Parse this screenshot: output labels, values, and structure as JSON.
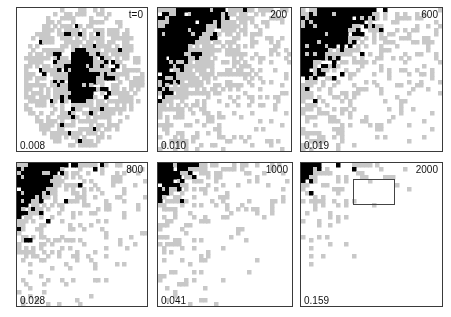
{
  "figure": {
    "width": 451,
    "height": 317,
    "background": "#ffffff",
    "colors": {
      "occupied": "#000000",
      "halo": "#c8c8c8",
      "empty": "#ffffff",
      "frame": "#3a3a3a",
      "text": "#111111",
      "roi": "#444444"
    },
    "grid": {
      "rows": 2,
      "cols": 3
    }
  },
  "panels": [
    {
      "id": "panel-t0",
      "time_label": "t=0",
      "value_side": "0.003",
      "value_bottom": "0.008",
      "rect": {
        "x": 16,
        "y": 7,
        "w": 132,
        "h": 145
      },
      "roi": null,
      "pattern": {
        "type": "blob",
        "cells": 36,
        "cx": 0.49,
        "cy": 0.48,
        "rx": 0.44,
        "ry": 0.46,
        "core_rx": 0.1,
        "core_ry": 0.2,
        "black_scatter_rx": 0.3,
        "black_scatter_ry": 0.34,
        "black_density": 0.3,
        "gray_density": 0.8,
        "elongation": 0.0,
        "seed": 1701
      }
    },
    {
      "id": "panel-t200",
      "time_label": "200",
      "value_side": "0.018",
      "value_bottom": "0.010",
      "rect": {
        "x": 157,
        "y": 7,
        "w": 135,
        "h": 145
      },
      "roi": null,
      "pattern": {
        "type": "band",
        "cells": 36,
        "band_top": 0.0,
        "band_bottom": 1.05,
        "band_width": 0.4,
        "black_band_center": 0.17,
        "black_band_halfwidth": 0.085,
        "black_density": 0.94,
        "gray_density": 0.52,
        "gray_falloff": 0.85,
        "seed": 220
      }
    },
    {
      "id": "panel-t600",
      "time_label": "600",
      "value_side": "0.058",
      "value_bottom": "0.019",
      "rect": {
        "x": 300,
        "y": 7,
        "w": 143,
        "h": 145
      },
      "roi": null,
      "pattern": {
        "type": "band",
        "cells": 36,
        "band_top": -0.05,
        "band_bottom": 1.05,
        "band_width": 0.36,
        "black_band_center": 0.22,
        "black_band_halfwidth": 0.075,
        "black_density": 0.93,
        "gray_density": 0.5,
        "gray_falloff": 0.8,
        "seed": 600
      }
    },
    {
      "id": "panel-t800",
      "time_label": "800",
      "value_side": "0.085",
      "value_bottom": "0.028",
      "rect": {
        "x": 16,
        "y": 162,
        "w": 132,
        "h": 145
      },
      "roi": null,
      "pattern": {
        "type": "band",
        "cells": 36,
        "band_top": -0.06,
        "band_bottom": 1.05,
        "band_width": 0.3,
        "black_band_center": 0.18,
        "black_band_halfwidth": 0.065,
        "black_density": 0.92,
        "gray_density": 0.46,
        "gray_falloff": 0.74,
        "seed": 800
      }
    },
    {
      "id": "panel-t1000",
      "time_label": "1000",
      "value_side": "0.117",
      "value_bottom": "0.041",
      "rect": {
        "x": 157,
        "y": 162,
        "w": 136,
        "h": 145
      },
      "roi": null,
      "pattern": {
        "type": "band",
        "cells": 36,
        "band_top": -0.08,
        "band_bottom": 1.05,
        "band_width": 0.26,
        "black_band_center": 0.15,
        "black_band_halfwidth": 0.058,
        "black_density": 0.93,
        "gray_density": 0.44,
        "gray_falloff": 0.68,
        "seed": 1000
      }
    },
    {
      "id": "panel-t2000",
      "time_label": "2000",
      "value_side": "0.314",
      "value_bottom": "0.159",
      "rect": {
        "x": 300,
        "y": 162,
        "w": 143,
        "h": 145
      },
      "roi": {
        "x": 52,
        "y": 16,
        "w": 42,
        "h": 26
      },
      "pattern": {
        "type": "band",
        "cells": 36,
        "band_top": -0.1,
        "band_bottom": 1.05,
        "band_width": 0.18,
        "black_band_center": 0.1,
        "black_band_halfwidth": 0.048,
        "black_density": 0.95,
        "gray_density": 0.42,
        "gray_falloff": 0.52,
        "seed": 2000
      }
    }
  ]
}
